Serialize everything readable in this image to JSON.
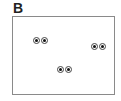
{
  "panel_label": "B",
  "pairs": [
    {
      "name": "dot-pair-1",
      "x": 33,
      "y": 37
    },
    {
      "name": "dot-pair-2",
      "x": 91,
      "y": 43
    },
    {
      "name": "dot-pair-3",
      "x": 57,
      "y": 66
    }
  ],
  "colors": {
    "border": "#8a8a8a",
    "dot_outline": "#444444",
    "dot_center": "#111111"
  }
}
